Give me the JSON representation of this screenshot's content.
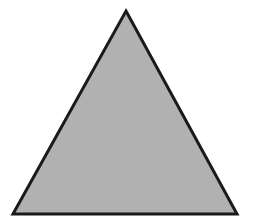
{
  "diagram": {
    "width": 253,
    "height": 223,
    "background": "#ffffff",
    "shapes": [
      {
        "type": "triangle",
        "kind": "equilateral",
        "points": [
          [
            126,
            11
          ],
          [
            237,
            214
          ],
          [
            13,
            214
          ]
        ],
        "fill": "#b1b1b1",
        "stroke": "#1a1a1a",
        "stroke_width": 3
      }
    ]
  }
}
